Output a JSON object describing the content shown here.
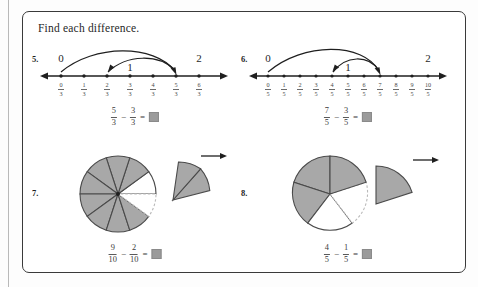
{
  "worksheet": {
    "title": "Find each difference.",
    "border_color": "#3a3a3a",
    "shade_color": "#a8a8a8",
    "answer_box_color": "#9b9b9b"
  },
  "problems": [
    {
      "number": "5.",
      "model": "number-line",
      "denominator": 3,
      "ticks": [
        "0",
        "1",
        "2",
        "3",
        "4",
        "5",
        "6"
      ],
      "whole_labels": [
        {
          "text": "0",
          "at_index": 0
        },
        {
          "text": "1",
          "at_index": 3
        },
        {
          "text": "2",
          "at_index": 6
        }
      ],
      "arcs": [
        {
          "from_index": 6,
          "to_index": 3,
          "label": "big-arc"
        },
        {
          "from_index": 5,
          "to_index": 2,
          "label": "small-arc"
        }
      ],
      "equation": {
        "minuend": {
          "numerator": "5",
          "denominator": "3"
        },
        "subtrahend": {
          "numerator": "3",
          "denominator": "3"
        },
        "minus": "−",
        "equals": "=",
        "answer": ""
      }
    },
    {
      "number": "6.",
      "model": "number-line",
      "denominator": 5,
      "ticks": [
        "0",
        "1",
        "2",
        "3",
        "4",
        "5",
        "6",
        "7",
        "8",
        "9",
        "10"
      ],
      "whole_labels": [
        {
          "text": "0",
          "at_index": 0
        },
        {
          "text": "1",
          "at_index": 5
        },
        {
          "text": "2",
          "at_index": 10
        }
      ],
      "arcs": [
        {
          "from_index": 7,
          "to_index": 0,
          "label": "big-arc"
        },
        {
          "from_index": 7,
          "to_index": 4,
          "label": "small-arc"
        }
      ],
      "equation": {
        "minuend": {
          "numerator": "7",
          "denominator": "5"
        },
        "subtrahend": {
          "numerator": "3",
          "denominator": "5"
        },
        "minus": "−",
        "equals": "=",
        "answer": ""
      }
    },
    {
      "number": "7.",
      "model": "circle",
      "total_slices": 10,
      "shaded_slices": 9,
      "removed_slices": 2,
      "arrow": "→",
      "equation": {
        "minuend": {
          "numerator": "9",
          "denominator": "10"
        },
        "subtrahend": {
          "numerator": "2",
          "denominator": "10"
        },
        "minus": "−",
        "equals": "=",
        "answer": ""
      }
    },
    {
      "number": "8.",
      "model": "circle",
      "total_slices": 5,
      "shaded_slices": 4,
      "removed_slices": 1,
      "arrow": "→",
      "equation": {
        "minuend": {
          "numerator": "4",
          "denominator": "5"
        },
        "subtrahend": {
          "numerator": "1",
          "denominator": "5"
        },
        "minus": "−",
        "equals": "=",
        "answer": ""
      }
    }
  ]
}
